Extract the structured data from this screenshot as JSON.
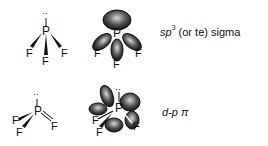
{
  "figure": {
    "molecule": "PF3",
    "rows": [
      {
        "structure": {
          "central_atom": "P",
          "ligands": [
            "F",
            "F",
            "F"
          ],
          "lone_pair": "··",
          "bond_type": "three single wedge bonds"
        },
        "orbital_diagram": {
          "central_atom": "P",
          "ligands": [
            "F",
            "F",
            "F"
          ],
          "lobes": 4
        },
        "label": {
          "prefix_italic": "sp",
          "superscript": "3",
          "suffix": "(or te) sigma"
        }
      },
      {
        "structure": {
          "central_atom": "P",
          "ligands": [
            "F",
            "F",
            "F"
          ],
          "lone_pair": "··",
          "bond_type": "two wedge bonds and one double bond"
        },
        "orbital_diagram": {
          "central_atom": "P",
          "ligands": [
            "F",
            "F",
            "F"
          ],
          "lone_pair": "··",
          "lobes": 5
        },
        "label": {
          "text_italic": "d-p",
          "symbol": "π"
        }
      }
    ]
  }
}
